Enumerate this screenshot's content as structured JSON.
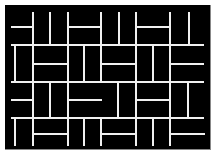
{
  "image": {
    "description": "Black rectangle with white basket-weave / maze line pattern",
    "background": "#000000",
    "line_color": "#f0f0f0",
    "frame": {
      "x": 5,
      "y": 5,
      "width": 205,
      "height": 144
    }
  },
  "lines": [
    {
      "x1": 33,
      "y1": 12,
      "x2": 33,
      "y2": 45
    },
    {
      "x1": 50,
      "y1": 12,
      "x2": 50,
      "y2": 45
    },
    {
      "x1": 68,
      "y1": 12,
      "x2": 68,
      "y2": 45
    },
    {
      "x1": 101,
      "y1": 12,
      "x2": 101,
      "y2": 45
    },
    {
      "x1": 119,
      "y1": 12,
      "x2": 119,
      "y2": 45
    },
    {
      "x1": 136,
      "y1": 12,
      "x2": 136,
      "y2": 45
    },
    {
      "x1": 170,
      "y1": 12,
      "x2": 170,
      "y2": 45
    },
    {
      "x1": 189,
      "y1": 12,
      "x2": 189,
      "y2": 45
    },
    {
      "x1": 11,
      "y1": 27,
      "x2": 33,
      "y2": 27
    },
    {
      "x1": 68,
      "y1": 27,
      "x2": 101,
      "y2": 27
    },
    {
      "x1": 136,
      "y1": 27,
      "x2": 170,
      "y2": 27
    },
    {
      "x1": 11,
      "y1": 45,
      "x2": 204,
      "y2": 45
    },
    {
      "x1": 15,
      "y1": 45,
      "x2": 15,
      "y2": 82
    },
    {
      "x1": 33,
      "y1": 45,
      "x2": 33,
      "y2": 82
    },
    {
      "x1": 68,
      "y1": 45,
      "x2": 68,
      "y2": 82
    },
    {
      "x1": 84,
      "y1": 45,
      "x2": 84,
      "y2": 82
    },
    {
      "x1": 101,
      "y1": 45,
      "x2": 101,
      "y2": 82
    },
    {
      "x1": 136,
      "y1": 45,
      "x2": 136,
      "y2": 82
    },
    {
      "x1": 153,
      "y1": 45,
      "x2": 153,
      "y2": 82
    },
    {
      "x1": 170,
      "y1": 45,
      "x2": 170,
      "y2": 82
    },
    {
      "x1": 33,
      "y1": 64,
      "x2": 68,
      "y2": 64
    },
    {
      "x1": 101,
      "y1": 64,
      "x2": 136,
      "y2": 64
    },
    {
      "x1": 170,
      "y1": 64,
      "x2": 204,
      "y2": 64
    },
    {
      "x1": 11,
      "y1": 82,
      "x2": 204,
      "y2": 82
    },
    {
      "x1": 33,
      "y1": 82,
      "x2": 33,
      "y2": 118
    },
    {
      "x1": 50,
      "y1": 82,
      "x2": 50,
      "y2": 118
    },
    {
      "x1": 68,
      "y1": 82,
      "x2": 68,
      "y2": 118
    },
    {
      "x1": 118,
      "y1": 82,
      "x2": 118,
      "y2": 118
    },
    {
      "x1": 136,
      "y1": 82,
      "x2": 136,
      "y2": 118
    },
    {
      "x1": 170,
      "y1": 82,
      "x2": 170,
      "y2": 118
    },
    {
      "x1": 188,
      "y1": 82,
      "x2": 188,
      "y2": 118
    },
    {
      "x1": 11,
      "y1": 100,
      "x2": 33,
      "y2": 100
    },
    {
      "x1": 68,
      "y1": 100,
      "x2": 102,
      "y2": 100
    },
    {
      "x1": 136,
      "y1": 100,
      "x2": 170,
      "y2": 100
    },
    {
      "x1": 11,
      "y1": 118,
      "x2": 204,
      "y2": 118
    },
    {
      "x1": 15,
      "y1": 118,
      "x2": 15,
      "y2": 146
    },
    {
      "x1": 33,
      "y1": 118,
      "x2": 33,
      "y2": 146
    },
    {
      "x1": 68,
      "y1": 118,
      "x2": 68,
      "y2": 146
    },
    {
      "x1": 84,
      "y1": 118,
      "x2": 84,
      "y2": 146
    },
    {
      "x1": 101,
      "y1": 118,
      "x2": 101,
      "y2": 146
    },
    {
      "x1": 136,
      "y1": 118,
      "x2": 136,
      "y2": 146
    },
    {
      "x1": 153,
      "y1": 118,
      "x2": 153,
      "y2": 146
    },
    {
      "x1": 170,
      "y1": 118,
      "x2": 170,
      "y2": 146
    },
    {
      "x1": 33,
      "y1": 134,
      "x2": 68,
      "y2": 134
    },
    {
      "x1": 101,
      "y1": 134,
      "x2": 136,
      "y2": 134
    },
    {
      "x1": 170,
      "y1": 134,
      "x2": 205,
      "y2": 134
    }
  ]
}
